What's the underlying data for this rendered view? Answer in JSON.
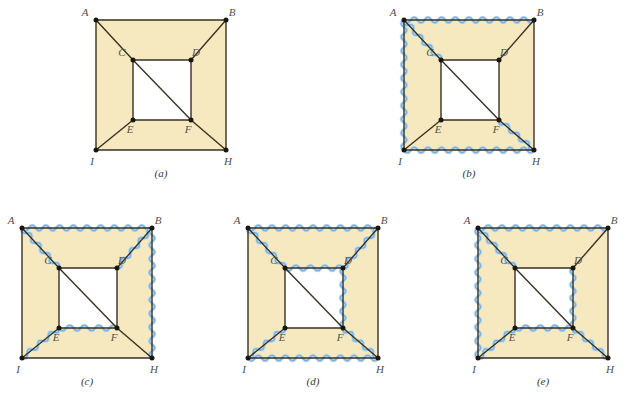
{
  "figure": {
    "kind": "graph-theory-diagram",
    "colors": {
      "page_background": "#ffffff",
      "face_fill": "#f6e9bf",
      "edge_stroke": "#3a3022",
      "vertex_dot": "#1a1712",
      "highlight_wave": "#7ab3dd",
      "highlight_wave_light": "#bcd9ee",
      "label_text": "#55503f",
      "caption_text": "#3a3730"
    },
    "vertex_labels": [
      "A",
      "B",
      "C",
      "D",
      "E",
      "F",
      "I",
      "H"
    ],
    "edges": [
      "A-B",
      "A-I",
      "I-H",
      "B-H",
      "C-D",
      "D-F",
      "E-F",
      "C-E",
      "A-C",
      "B-D",
      "I-E",
      "F-H",
      "C-F"
    ],
    "panels": [
      {
        "id": "a",
        "caption": "(a)",
        "x": 96,
        "y": 20,
        "highlighted": []
      },
      {
        "id": "b",
        "caption": "(b)",
        "x": 404,
        "y": 20,
        "highlighted": [
          "A-B",
          "A-I",
          "I-H",
          "A-C",
          "F-H"
        ]
      },
      {
        "id": "c",
        "caption": "(c)",
        "x": 22,
        "y": 228,
        "highlighted": [
          "A-B",
          "B-H",
          "A-C",
          "B-D",
          "I-E",
          "E-F"
        ]
      },
      {
        "id": "d",
        "caption": "(d)",
        "x": 248,
        "y": 228,
        "highlighted": [
          "A-B",
          "I-H",
          "A-C",
          "B-D",
          "C-D",
          "D-F",
          "I-E",
          "F-H"
        ]
      },
      {
        "id": "e",
        "caption": "(e)",
        "x": 478,
        "y": 228,
        "highlighted": [
          "A-B",
          "A-I",
          "A-C",
          "D-F",
          "E-F",
          "I-E",
          "F-H"
        ]
      }
    ],
    "geometry": {
      "size": 130,
      "outer": {
        "A": [
          0,
          0
        ],
        "B": [
          130,
          0
        ],
        "I": [
          0,
          130
        ],
        "H": [
          130,
          130
        ]
      },
      "inner": {
        "C": [
          37,
          40
        ],
        "D": [
          95,
          40
        ],
        "E": [
          37,
          100
        ],
        "F": [
          95,
          100
        ]
      },
      "label_offsets": {
        "A": [
          -11,
          -4
        ],
        "B": [
          6,
          -4
        ],
        "C": [
          -11,
          -4
        ],
        "D": [
          5,
          -4
        ],
        "E": [
          -3,
          13
        ],
        "F": [
          -3,
          13
        ],
        "I": [
          -4,
          15
        ],
        "H": [
          2,
          15
        ]
      },
      "caption_offset": [
        65,
        157
      ]
    }
  }
}
